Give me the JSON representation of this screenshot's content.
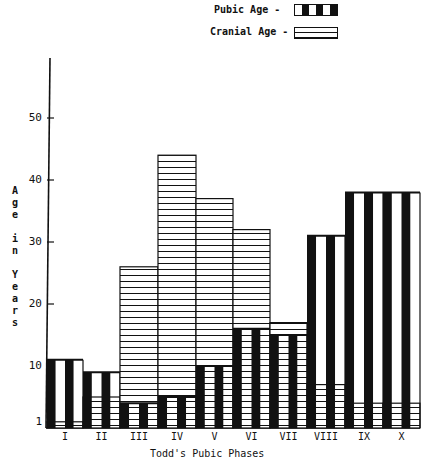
{
  "legend": {
    "pubic_label": "Pubic Age -",
    "cranial_label": "Cranial Age -"
  },
  "axes": {
    "ylabel": "Age in Years",
    "xlabel": "Todd's Pubic Phases",
    "yticks": [
      "1",
      "10",
      "20",
      "30",
      "40",
      "50"
    ]
  },
  "chart_data": {
    "type": "bar",
    "title": "",
    "xlabel": "Todd's Pubic Phases",
    "ylabel": "Age in Years",
    "categories": [
      "I",
      "II",
      "III",
      "IV",
      "V",
      "VI",
      "VII",
      "VIII",
      "IX",
      "X"
    ],
    "series": [
      {
        "name": "Pubic Age",
        "pattern": "vertical black stripes",
        "values": [
          11,
          9,
          4,
          5,
          10,
          16,
          15,
          31,
          38,
          38
        ]
      },
      {
        "name": "Cranial Age",
        "pattern": "horizontal lines",
        "values": [
          1,
          5,
          26,
          44,
          37,
          32,
          17,
          7,
          4,
          4
        ]
      }
    ],
    "yticks": [
      1,
      10,
      20,
      30,
      40,
      50
    ],
    "ylim": [
      0,
      60
    ],
    "grid": false,
    "legend_position": "top-right",
    "overlaid": true
  }
}
